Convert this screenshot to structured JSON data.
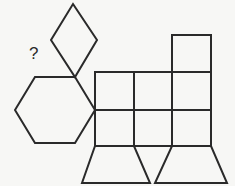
{
  "figure": {
    "question_mark": "?",
    "stroke_color": "#2a2a2a",
    "background_color": "#f7f7f5",
    "shapes": [
      {
        "type": "rhombus",
        "count": 1
      },
      {
        "type": "hexagon",
        "count": 1
      },
      {
        "type": "square",
        "count": 7
      },
      {
        "type": "trapezoid",
        "count": 2
      }
    ]
  }
}
